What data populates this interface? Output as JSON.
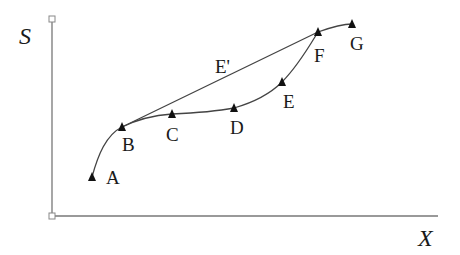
{
  "diagram": {
    "axes": {
      "y_label": "S",
      "x_label": "X"
    },
    "points": [
      {
        "id": "A",
        "label": "A",
        "x": 92,
        "y": 177,
        "lx": 106,
        "ly": 184
      },
      {
        "id": "B",
        "label": "B",
        "x": 122,
        "y": 127,
        "lx": 122,
        "ly": 151
      },
      {
        "id": "C",
        "label": "C",
        "x": 172,
        "y": 114,
        "lx": 166,
        "ly": 141
      },
      {
        "id": "D",
        "label": "D",
        "x": 234,
        "y": 108,
        "lx": 230,
        "ly": 134
      },
      {
        "id": "E",
        "label": "E",
        "x": 282,
        "y": 82,
        "lx": 283,
        "ly": 108
      },
      {
        "id": "F",
        "label": "F",
        "x": 318,
        "y": 32,
        "lx": 314,
        "ly": 62
      },
      {
        "id": "G",
        "label": "G",
        "x": 352,
        "y": 24,
        "lx": 350,
        "ly": 50
      }
    ],
    "direct_path_label": "E'",
    "colors": {
      "line": "#444444",
      "marker": "#111111",
      "axis": "#777777"
    }
  }
}
